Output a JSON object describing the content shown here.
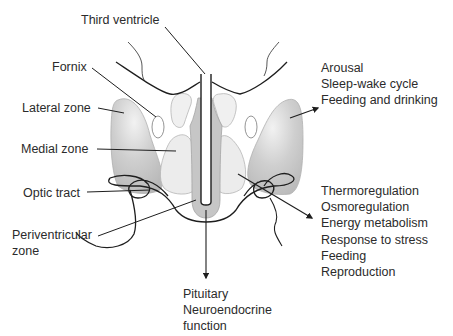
{
  "labels": {
    "third_ventricle": "Third ventricle",
    "fornix": "Fornix",
    "lateral_zone": "Lateral zone",
    "medial_zone": "Medial zone",
    "optic_tract": "Optic tract",
    "periventricular_zone": [
      "Periventricular",
      "zone"
    ]
  },
  "functions": {
    "lateral": [
      "Arousal",
      "Sleep-wake cycle",
      "Feeding and drinking"
    ],
    "medial": [
      "Thermoregulation",
      "Osmoregulation",
      "Energy metabolism",
      "Response to stress",
      "Feeding",
      "Reproduction"
    ],
    "periventricular": [
      "Pituitary",
      "Neuroendocrine",
      "function"
    ]
  },
  "colors": {
    "lateral_zone_fill": "#bdbdbd",
    "medial_zone_fill": "#e6e6e6",
    "periventricular_fill": "#c4c4c4",
    "outline": "#1e1e1e",
    "zone_outline": "#a8a8a8"
  }
}
